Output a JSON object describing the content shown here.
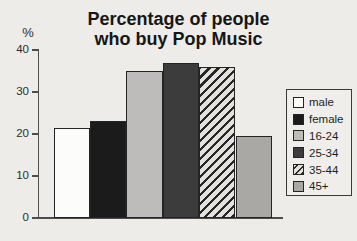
{
  "page": {
    "background": "#edece9"
  },
  "chart_data": {
    "type": "bar",
    "title": "Percentage of people who buy Pop Music",
    "title_lines": [
      "Percentage of people",
      "who buy Pop Music"
    ],
    "ylabel": "%",
    "xlabel": "",
    "ylim": [
      0,
      40
    ],
    "yticks": [
      0,
      10,
      20,
      30,
      40
    ],
    "grid": false,
    "legend_position": "right",
    "categories": [
      "male",
      "female",
      "16-24",
      "25-34",
      "35-44",
      "45+"
    ],
    "values": [
      21.5,
      23,
      35,
      37,
      36,
      19.5
    ],
    "bar_styles": [
      {
        "label": "male",
        "pattern": "solid",
        "fill": "#fcfcfb"
      },
      {
        "label": "female",
        "pattern": "solid",
        "fill": "#1b1b1b"
      },
      {
        "label": "16-24",
        "pattern": "solid",
        "fill": "#bdbcba"
      },
      {
        "label": "25-34",
        "pattern": "solid",
        "fill": "#3c3c3c"
      },
      {
        "label": "35-44",
        "pattern": "diagonal-hatch",
        "fill": "#e2e1de",
        "hatch_color": "#262626"
      },
      {
        "label": "45+",
        "pattern": "solid",
        "fill": "#a9a8a5"
      }
    ],
    "colors": {
      "bar_border": "#242424",
      "axis": "#4d4d4d",
      "text": "#2c2c2c",
      "legend_border": "#3a3a3a"
    }
  }
}
